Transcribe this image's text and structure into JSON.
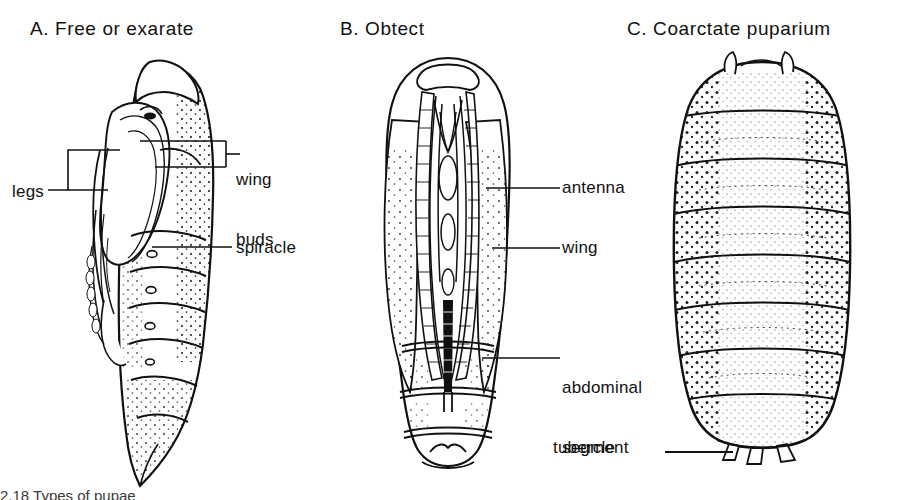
{
  "figure": {
    "background": "#ffffff",
    "ink": "#111111",
    "caption_fragment": "2.18  Types of pupae"
  },
  "panels": [
    {
      "id": "A",
      "title": "A.  Free or exarate",
      "labels": [
        {
          "name": "wing-buds",
          "text": "wing\nbuds",
          "lines": [
            "wing",
            "buds"
          ]
        },
        {
          "name": "legs",
          "text": "legs"
        },
        {
          "name": "spiracle",
          "text": "spiracle"
        }
      ]
    },
    {
      "id": "B",
      "title": "B.  Obtect",
      "labels": [
        {
          "name": "antenna",
          "text": "antenna"
        },
        {
          "name": "wing",
          "text": "wing"
        },
        {
          "name": "abdominal-segment",
          "text": "abdominal\nsegment",
          "lines": [
            "abdominal",
            "segment"
          ]
        }
      ]
    },
    {
      "id": "C",
      "title": "C.  Coarctate puparium",
      "labels": [
        {
          "name": "tubercle",
          "text": "tubercle"
        }
      ]
    }
  ]
}
